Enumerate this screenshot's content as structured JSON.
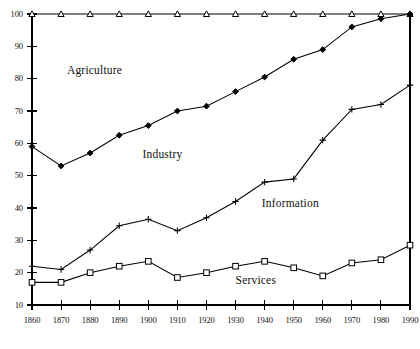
{
  "chart_data": {
    "type": "line",
    "title": "",
    "subtitle": "",
    "xlabel": "",
    "ylabel": "",
    "x": [
      1860,
      1870,
      1880,
      1890,
      1900,
      1910,
      1920,
      1930,
      1940,
      1950,
      1960,
      1970,
      1980,
      1990
    ],
    "xtick_labels": [
      "1860",
      "1870",
      "1880",
      "1890",
      "1900",
      "1910",
      "1920",
      "1930",
      "1940",
      "1950",
      "1960",
      "1970",
      "1980",
      "1990"
    ],
    "ytick_labels": [
      "10",
      "20",
      "30",
      "40",
      "50",
      "60",
      "70",
      "80",
      "90",
      "100"
    ],
    "yticks": [
      10,
      20,
      30,
      40,
      50,
      60,
      70,
      80,
      90,
      100
    ],
    "xlim": [
      1860,
      1990
    ],
    "ylim": [
      10,
      100
    ],
    "grid": false,
    "legend_position": "inline-annotations",
    "series": [
      {
        "name": "Agriculture",
        "marker": "triangle-open",
        "values": [
          100,
          100,
          100,
          100,
          100,
          100,
          100,
          100,
          100,
          100,
          100,
          100,
          100,
          100
        ]
      },
      {
        "name": "Industry",
        "marker": "diamond-solid",
        "values": [
          59,
          53,
          57,
          62.5,
          65.5,
          70,
          71.5,
          76,
          80.5,
          86,
          89,
          96,
          98.5,
          100
        ]
      },
      {
        "name": "Information",
        "marker": "plus",
        "values": [
          22,
          21,
          27,
          34.5,
          36.5,
          33,
          37,
          42,
          48,
          49,
          61,
          70.5,
          72,
          78
        ]
      },
      {
        "name": "Services",
        "marker": "square-open",
        "values": [
          17,
          17,
          20,
          22,
          23.5,
          18.5,
          20,
          22,
          23.5,
          21.5,
          19,
          23,
          24,
          28.5
        ]
      }
    ],
    "annotations": [
      {
        "text": "Agriculture",
        "x": 1872,
        "y": 82
      },
      {
        "text": "Industry",
        "x": 1898,
        "y": 56
      },
      {
        "text": "Information",
        "x": 1939,
        "y": 41
      },
      {
        "text": "Services",
        "x": 1930,
        "y": 17
      }
    ],
    "colors": {
      "line": "#000000",
      "axis": "#000000",
      "background": "#ffffff",
      "marker_fill": "#ffffff"
    }
  }
}
